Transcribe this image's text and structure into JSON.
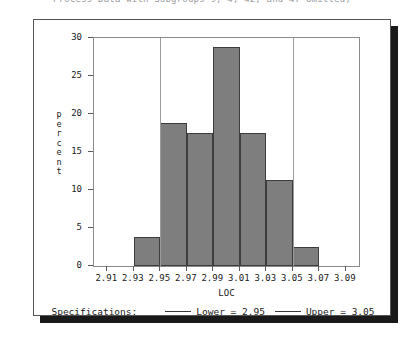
{
  "window": {
    "clipped_title": "Process Data with Subgroups 9, 4, 42, and 47 Omitted)"
  },
  "colors": {
    "bar_fill": "#7e7e7e",
    "bar_edge": "#3d3d3d",
    "spec_line": "#9b9b9b",
    "axis": "#5a5a5a",
    "panel_border": "#555555",
    "shadow": "#1a1a1a"
  },
  "legend": {
    "title": "Specifications:",
    "entries": [
      {
        "label": "Lower = 2.95"
      },
      {
        "label": "Upper = 3.05"
      }
    ]
  },
  "chart_data": {
    "type": "bar",
    "title": "",
    "xlabel": "LOC",
    "ylabel": "percent",
    "ylabel_letters": [
      "p",
      "e",
      "r",
      "c",
      "e",
      "n",
      "t"
    ],
    "xlim": [
      2.9,
      3.1
    ],
    "ylim": [
      0,
      30
    ],
    "grid": false,
    "legend_position": "bottom",
    "xticks": [
      2.91,
      2.93,
      2.95,
      2.97,
      2.99,
      3.01,
      3.03,
      3.05,
      3.07,
      3.09
    ],
    "xtick_labels": [
      "2.91",
      "2.93",
      "2.95",
      "2.97",
      "2.99",
      "3.01",
      "3.03",
      "3.05",
      "3.07",
      "3.09"
    ],
    "yticks": [
      0,
      5,
      10,
      15,
      20,
      25,
      30
    ],
    "ytick_labels": [
      "0",
      "5",
      "10",
      "15",
      "20",
      "25",
      "30"
    ],
    "bin_width": 0.02,
    "bin_starts": [
      2.93,
      2.95,
      2.97,
      2.99,
      3.01,
      3.03,
      3.05
    ],
    "bin_centers": [
      2.94,
      2.96,
      2.98,
      3.0,
      3.02,
      3.04,
      3.06
    ],
    "categories": [
      "2.93-2.95",
      "2.95-2.97",
      "2.97-2.99",
      "2.99-3.01",
      "3.01-3.03",
      "3.03-3.05",
      "3.05-3.07"
    ],
    "values": [
      3.8,
      18.8,
      17.5,
      28.8,
      17.5,
      11.3,
      2.5
    ],
    "annotations": [
      {
        "name": "lower-spec",
        "x": 2.95,
        "label": "Lower = 2.95"
      },
      {
        "name": "upper-spec",
        "x": 3.05,
        "label": "Upper = 3.05"
      }
    ]
  }
}
